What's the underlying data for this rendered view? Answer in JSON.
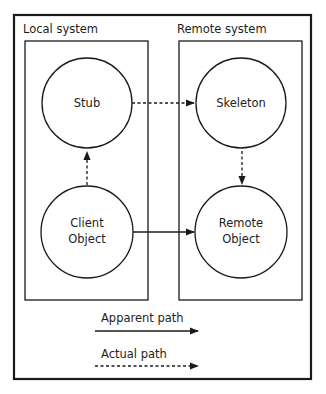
{
  "diagram": {
    "type": "rmi-architecture",
    "regions": [
      {
        "id": "local",
        "label": "Local system"
      },
      {
        "id": "remote",
        "label": "Remote system"
      }
    ],
    "nodes": [
      {
        "id": "stub",
        "lines": [
          "Stub"
        ],
        "region": "local"
      },
      {
        "id": "client",
        "lines": [
          "Client",
          "Object"
        ],
        "region": "local"
      },
      {
        "id": "skeleton",
        "lines": [
          "Skeleton"
        ],
        "region": "remote"
      },
      {
        "id": "remote_obj",
        "lines": [
          "Remote",
          "Object"
        ],
        "region": "remote"
      }
    ],
    "edges": [
      {
        "from": "client",
        "to": "stub",
        "style": "dashed",
        "meaning": "actual"
      },
      {
        "from": "stub",
        "to": "skeleton",
        "style": "dashed",
        "meaning": "actual"
      },
      {
        "from": "skeleton",
        "to": "remote_obj",
        "style": "dashed",
        "meaning": "actual"
      },
      {
        "from": "client",
        "to": "remote_obj",
        "style": "solid",
        "meaning": "apparent"
      }
    ],
    "legend": [
      {
        "label": "Apparent path",
        "style": "solid"
      },
      {
        "label": "Actual path",
        "style": "dashed"
      }
    ]
  },
  "labels": {
    "local_system": "Local system",
    "remote_system": "Remote system",
    "stub": "Stub",
    "client_line1": "Client",
    "client_line2": "Object",
    "skeleton": "Skeleton",
    "remote_line1": "Remote",
    "remote_line2": "Object",
    "legend_apparent": "Apparent path",
    "legend_actual": "Actual path"
  },
  "colors": {
    "stroke": "#1a1a1a",
    "background": "#ffffff"
  }
}
